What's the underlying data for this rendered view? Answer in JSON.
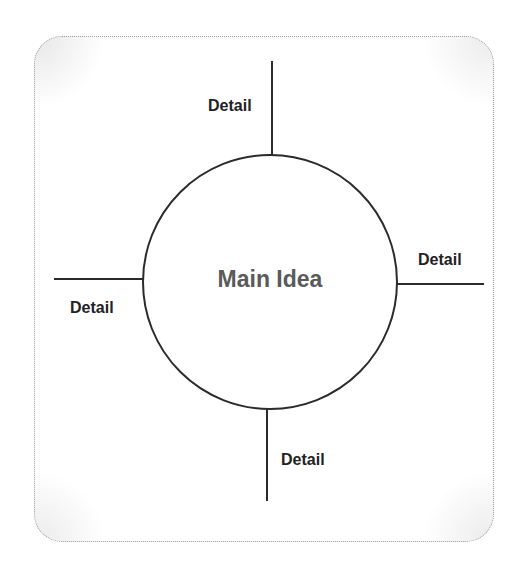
{
  "diagram": {
    "type": "concept-map",
    "center": {
      "label": "Main Idea",
      "color": "#5a5a5a"
    },
    "branches": [
      {
        "position": "top",
        "label": "Detail"
      },
      {
        "position": "right",
        "label": "Detail"
      },
      {
        "position": "bottom",
        "label": "Detail"
      },
      {
        "position": "left",
        "label": "Detail"
      }
    ],
    "colors": {
      "line": "#2b2b2b",
      "label": "#222222",
      "frame_border": "#9a9a9a",
      "background": "#ffffff"
    }
  }
}
